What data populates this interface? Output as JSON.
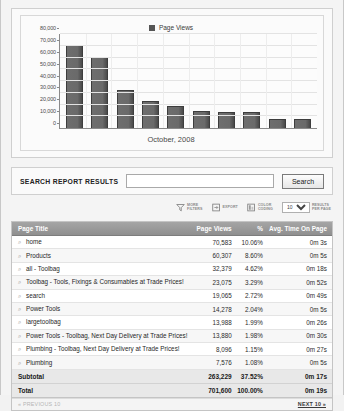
{
  "chart_data": {
    "type": "bar",
    "title": "",
    "legend": [
      "Page Views"
    ],
    "legend_position": "top-center",
    "xlabel": "October, 2008",
    "ylabel": "",
    "ylim": [
      0,
      80000
    ],
    "yticks": [
      "0",
      "10,000",
      "20,000",
      "30,000",
      "40,000",
      "50,000",
      "60,000",
      "70,000",
      "80,000"
    ],
    "grid": true,
    "categories": [
      "home",
      "Products",
      "all - Toolbag",
      "Toolbag - Tools, Fixings & Consumables at Trade Prices!",
      "search",
      "Power Tools",
      "largetoolbag",
      "Power Tools - Toolbag, Next Day Delivery at Trade Prices!",
      "Plumbing - Toolbag, Next Day Delivery at Trade Prices!",
      "Plumbing"
    ],
    "values": [
      70583,
      60307,
      32379,
      23075,
      19065,
      14278,
      13988,
      13880,
      8096,
      7576
    ],
    "series": [
      {
        "name": "Page Views",
        "values": [
          70583,
          60307,
          32379,
          23075,
          19065,
          14278,
          13988,
          13880,
          8096,
          7576
        ]
      }
    ],
    "bar_color": "#5c5c5c"
  },
  "search": {
    "label": "SEARCH REPORT RESULTS",
    "value": "",
    "placeholder": "",
    "button_label": "Search"
  },
  "toolbar": {
    "items": [
      {
        "icon": "funnel-icon",
        "label": "MORE\nFILTERS"
      },
      {
        "icon": "export-icon",
        "label": "EXPORT"
      },
      {
        "icon": "color-coding-icon",
        "label": "COLOR\nCODING"
      }
    ],
    "results_per_page": {
      "value": "10",
      "options": [
        "10",
        "25",
        "50",
        "100"
      ],
      "label": "RESULTS\nPER PAGE"
    }
  },
  "table": {
    "columns": [
      "Page Title",
      "Page Views",
      "%",
      "Avg. Time On Page"
    ],
    "rows": [
      {
        "title": "home",
        "views": "70,583",
        "pct": "10.06%",
        "time": "0m 3s"
      },
      {
        "title": "Products",
        "views": "60,307",
        "pct": "8.60%",
        "time": "0m 5s"
      },
      {
        "title": "all - Toolbag",
        "views": "32,379",
        "pct": "4.62%",
        "time": "0m 18s"
      },
      {
        "title": "Toolbag - Tools, Fixings & Consumables at Trade Prices!",
        "views": "23,075",
        "pct": "3.29%",
        "time": "0m 52s"
      },
      {
        "title": "search",
        "views": "19,065",
        "pct": "2.72%",
        "time": "0m 49s"
      },
      {
        "title": "Power Tools",
        "views": "14,278",
        "pct": "2.04%",
        "time": "0m 5s"
      },
      {
        "title": "largetoolbag",
        "views": "13,988",
        "pct": "1.99%",
        "time": "0m 26s"
      },
      {
        "title": "Power Tools - Toolbag, Next Day Delivery at Trade Prices!",
        "views": "13,880",
        "pct": "1.98%",
        "time": "0m 30s"
      },
      {
        "title": "Plumbing - Toolbag, Next Day Delivery at Trade Prices!",
        "views": "8,096",
        "pct": "1.15%",
        "time": "0m 27s"
      },
      {
        "title": "Plumbing",
        "views": "7,576",
        "pct": "1.08%",
        "time": "0m 5s"
      }
    ],
    "subtotal": {
      "label": "Subtotal",
      "views": "263,229",
      "pct": "37.52%",
      "time": "0m 17s"
    },
    "total": {
      "label": "Total",
      "views": "701,600",
      "pct": "100.00%",
      "time": "0m 19s"
    }
  },
  "pager": {
    "previous": "« PREVIOUS 10",
    "next": "NEXT 10 »"
  }
}
